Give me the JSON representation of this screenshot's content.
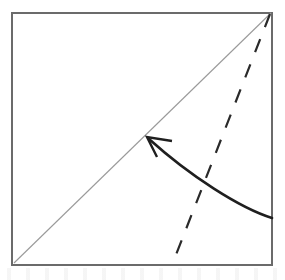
{
  "diagram": {
    "canvas": {
      "width": 285,
      "height": 280,
      "background": "#ffffff"
    },
    "colors": {
      "paper_edge": "#6b6b6b",
      "existing_crease": "#9a9a9a",
      "valley_fold": "#2a2a2a",
      "fold_arrow": "#1f1f1f"
    },
    "paper": {
      "shape_name": "square-sheet",
      "left": 12,
      "top": 13,
      "right": 272,
      "bottom": 265,
      "stroke_width": 2
    },
    "existing_crease": {
      "label": "diagonal crease",
      "x1": 14,
      "y1": 263,
      "x2": 271,
      "y2": 13,
      "stroke_width": 1.1
    },
    "valley_fold": {
      "label": "valley fold line",
      "style": "dashed",
      "x1": 270,
      "y1": 14,
      "x2": 172,
      "y2": 265,
      "stroke_width": 2.2,
      "dash_length": 14,
      "gap_length": 13
    },
    "fold_arrow": {
      "label": "fold direction arrow",
      "path": "M 272 218 C 240 208, 190 176, 149 139",
      "stroke_width": 2.6,
      "head": {
        "tip_x": 147,
        "tip_y": 137,
        "path": "M 172 141 L 147 137 L 157 157"
      }
    }
  }
}
